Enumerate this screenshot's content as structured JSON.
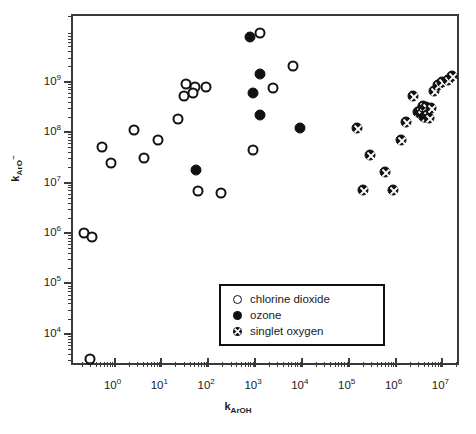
{
  "chart_data": {
    "type": "scatter",
    "title": "",
    "xlabel": "k_ArOH",
    "ylabel": "k_ArO-",
    "xlabel_parts": {
      "base": "k",
      "sub": "ArOH"
    },
    "ylabel_parts": {
      "base": "k",
      "sub": "ArO",
      "sup": "-"
    },
    "xscale": "log",
    "yscale": "log",
    "xlim": [
      0.13,
      25000000
    ],
    "ylim": [
      2200,
      20000000000
    ],
    "x_tick_labels": [
      "10^0",
      "10^1",
      "10^2",
      "10^3",
      "10^4",
      "10^5",
      "10^6",
      "10^7"
    ],
    "x_tick_values": [
      1,
      10,
      100,
      1000,
      10000,
      100000,
      1000000,
      10000000
    ],
    "y_tick_labels": [
      "10^4",
      "10^5",
      "10^6",
      "10^7",
      "10^8",
      "10^9"
    ],
    "y_tick_values": [
      10000,
      100000,
      1000000,
      10000000,
      100000000,
      1000000000
    ],
    "grid": false,
    "legend_position": "lower-right",
    "legend_entries": [
      {
        "marker": "open-circle",
        "label": "chlorine dioxide"
      },
      {
        "marker": "filled-circle",
        "label": "ozone"
      },
      {
        "marker": "crossed-circle",
        "label": "singlet oxygen"
      }
    ],
    "series": [
      {
        "name": "chlorine dioxide",
        "marker": "open-circle",
        "points": [
          [
            0.22,
            1000000
          ],
          [
            0.33,
            830000
          ],
          [
            0.55,
            50000000.0
          ],
          [
            0.85,
            24000000.0
          ],
          [
            2.6,
            110000000.0
          ],
          [
            4.3,
            30000000.0
          ],
          [
            8.5,
            70000000.0
          ],
          [
            23,
            180000000.0
          ],
          [
            33,
            900000000.0
          ],
          [
            30,
            520000000.0
          ],
          [
            52,
            780000000.0
          ],
          [
            48,
            600000000.0
          ],
          [
            90,
            780000000.0
          ],
          [
            62,
            6800000.0
          ],
          [
            190,
            6300000.0
          ],
          [
            900,
            45000000.0
          ],
          [
            1300,
            9000000000.0
          ],
          [
            2400,
            750000000.0
          ],
          [
            6500,
            2000000000.0
          ],
          [
            0.3,
            3200.0
          ]
        ]
      },
      {
        "name": "ozone",
        "marker": "filled-circle",
        "points": [
          [
            55,
            18000000.0
          ],
          [
            800,
            7500000000.0
          ],
          [
            900,
            600000000.0
          ],
          [
            1300,
            1400000000.0
          ],
          [
            1250,
            220000000.0
          ],
          [
            9000,
            120000000.0
          ]
        ]
      },
      {
        "name": "singlet oxygen",
        "marker": "crossed-circle",
        "points": [
          [
            150000,
            120000000.0
          ],
          [
            200000,
            7000000.0
          ],
          [
            280000,
            35000000.0
          ],
          [
            600000,
            16000000.0
          ],
          [
            900000,
            7000000.0
          ],
          [
            1300000,
            70000000.0
          ],
          [
            1700000,
            160000000.0
          ],
          [
            2400000,
            520000000.0
          ],
          [
            3000000,
            250000000.0
          ],
          [
            3300000,
            260000000.0
          ],
          [
            3500000,
            230000000.0
          ],
          [
            3900000,
            330000000.0
          ],
          [
            4000000,
            200000000.0
          ],
          [
            4300000,
            200000000.0
          ],
          [
            4500000,
            320000000.0
          ],
          [
            4800000,
            220000000.0
          ],
          [
            5200000,
            190000000.0
          ],
          [
            5600000,
            300000000.0
          ],
          [
            6500000,
            650000000.0
          ],
          [
            8000000,
            850000000.0
          ],
          [
            10000000,
            1000000000.0
          ],
          [
            13000000,
            1100000000.0
          ],
          [
            16000000,
            1300000000.0
          ]
        ]
      }
    ]
  }
}
